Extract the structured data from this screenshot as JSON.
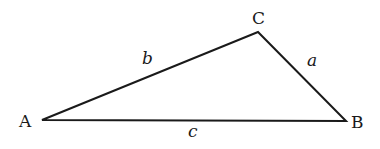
{
  "diagram": {
    "type": "triangle",
    "vertices": [
      {
        "label": "A",
        "x": 42,
        "y": 120
      },
      {
        "label": "B",
        "x": 346,
        "y": 121
      },
      {
        "label": "C",
        "x": 258,
        "y": 32
      }
    ],
    "sides": [
      {
        "label": "a",
        "from": "B",
        "to": "C"
      },
      {
        "label": "b",
        "from": "A",
        "to": "C"
      },
      {
        "label": "c",
        "from": "A",
        "to": "B"
      }
    ]
  }
}
